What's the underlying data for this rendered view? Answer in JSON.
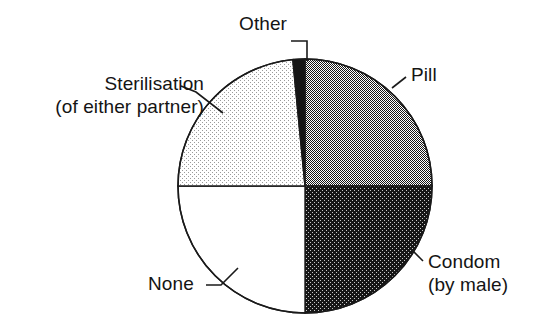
{
  "chart_data": {
    "type": "pie",
    "title": "",
    "subtitle": "",
    "xlabel": "",
    "ylabel": "",
    "legend_position": "none",
    "grid": false,
    "labels_are_leader_lines": true,
    "total_degrees": 360,
    "categories": [
      "Pill",
      "Condom (by male)",
      "None",
      "Sterilisation (of either partner)",
      "Other"
    ],
    "values": [
      25,
      25,
      25,
      23.5,
      1.5
    ],
    "slices": [
      {
        "name": "Pill",
        "label_line1": "Pill",
        "label_line2": "",
        "value": 25,
        "start_angle": 0,
        "end_angle": 90,
        "fill": "#8a8a8a",
        "pattern": "medium-gray-dither",
        "stroke": "#1a1a1a"
      },
      {
        "name": "Condom (by male)",
        "label_line1": "Condom",
        "label_line2": "(by male)",
        "value": 25,
        "start_angle": 90,
        "end_angle": 180,
        "fill": "#3f3f3f",
        "pattern": "dark-gray-dither",
        "stroke": "#1a1a1a"
      },
      {
        "name": "None",
        "label_line1": "None",
        "label_line2": "",
        "value": 25,
        "start_angle": 180,
        "end_angle": 270,
        "fill": "#ffffff",
        "pattern": "solid-white",
        "stroke": "#1a1a1a"
      },
      {
        "name": "Sterilisation (of either partner)",
        "label_line1": "Sterilisation",
        "label_line2": "(of either partner)",
        "value": 23.5,
        "start_angle": 270,
        "end_angle": 354.5,
        "fill": "#d4d4d4",
        "pattern": "light-gray-dither",
        "stroke": "#1a1a1a"
      },
      {
        "name": "Other",
        "label_line1": "Other",
        "label_line2": "",
        "value": 1.5,
        "start_angle": 354.5,
        "end_angle": 360,
        "fill": "#161616",
        "pattern": "solid-near-black",
        "stroke": "#1a1a1a"
      }
    ],
    "geometry": {
      "center_x": 305,
      "center_y": 186,
      "radius": 127
    }
  },
  "colors": {
    "background": "#ffffff",
    "outline": "#1a1a1a",
    "text": "#141414",
    "pill_fill": "#8a8a8a",
    "condom_fill": "#3f3f3f",
    "none_fill": "#ffffff",
    "sterilisation_fill": "#d4d4d4",
    "other_fill": "#161616"
  }
}
